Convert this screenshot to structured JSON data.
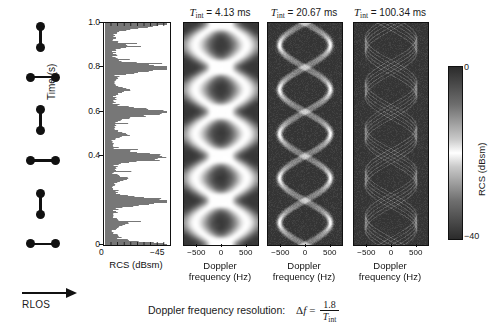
{
  "figure": {
    "caption_prefix": "Doppler frequency resolution:",
    "equation": {
      "lhs": "Δf",
      "eq": "=",
      "numerator": "1.8",
      "denominator": "T",
      "denominator_sub": "int"
    }
  },
  "target_diagram": {
    "name": "rotating-dumbbell-target",
    "arrow_label": "RLOS",
    "poses": [
      "vertical",
      "horizontal",
      "vertical",
      "horizontal",
      "vertical",
      "horizontal"
    ]
  },
  "rcs_panel": {
    "name": "rcs-time-series",
    "xlabel": "RCS (dBsm)",
    "ylabel": "Time (s)",
    "xticks": [
      "0",
      "−45"
    ],
    "yticks": [
      "1.0",
      "0.8",
      "0.6",
      "0.4",
      "0"
    ]
  },
  "spectrograms": [
    {
      "title_var": "T",
      "title_sub": "int",
      "title_eq": "=",
      "title_value": "4.13",
      "title_unit": "ms",
      "xlabel_line1": "Doppler",
      "xlabel_line2": "frequency (Hz)",
      "xticks": [
        "−500",
        "0",
        "500"
      ],
      "blur": 14.0
    },
    {
      "title_var": "T",
      "title_sub": "int",
      "title_eq": "=",
      "title_value": "20.67",
      "title_unit": "ms",
      "xlabel_line1": "Doppler",
      "xlabel_line2": "frequency (Hz)",
      "xticks": [
        "−500",
        "0",
        "500"
      ],
      "blur": 3.0
    },
    {
      "title_var": "T",
      "title_sub": "int",
      "title_eq": "=",
      "title_value": "100.34",
      "title_unit": "ms",
      "xlabel_line1": "Doppler",
      "xlabel_line2": "frequency (Hz)",
      "xticks": [
        "−500",
        "0",
        "500"
      ],
      "blur": 1.1
    }
  ],
  "colorbar": {
    "label": "RCS (dBsm)",
    "max": "0",
    "min": "−40"
  },
  "chart_data": {
    "type": "heatmap",
    "xlabel": "Doppler frequency (Hz)",
    "ylabel": "Time (s)",
    "xlim": [
      -750,
      750
    ],
    "ylim": [
      0,
      1.0
    ],
    "colorbar": {
      "label": "RCS (dBsm)",
      "range": [
        -40,
        0
      ]
    },
    "panels": [
      {
        "name": "T_int = 4.13 ms",
        "integration_time_ms": 4.13,
        "doppler_resolution_hz": 435.8
      },
      {
        "name": "T_int = 20.67 ms",
        "integration_time_ms": 20.67,
        "doppler_resolution_hz": 87.1
      },
      {
        "name": "T_int = 100.34 ms",
        "integration_time_ms": 100.34,
        "doppler_resolution_hz": 17.9
      }
    ],
    "signal_model": {
      "description": "Two point scatterers on a rotating rod produce sinusoidal micro-Doppler traces",
      "amplitude_hz": 520,
      "rotation_period_s": 0.4,
      "phase_offsets_rad": [
        0,
        3.14159
      ]
    },
    "rcs_series": {
      "type": "line",
      "xlabel": "RCS (dBsm)",
      "ylabel": "Time (s)",
      "xlim": [
        0,
        -45
      ],
      "ylim": [
        0,
        1.0
      ]
    }
  }
}
